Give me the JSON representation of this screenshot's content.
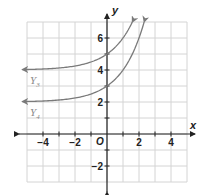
{
  "chart_data": {
    "type": "line",
    "title": "",
    "xlabel": "x",
    "ylabel": "y",
    "origin_label": "O",
    "xlim": [
      -5,
      5
    ],
    "ylim": [
      -3,
      7
    ],
    "grid": true,
    "x_ticks": [
      -4,
      -2,
      2,
      4
    ],
    "x_tick_labels": [
      "−4",
      "−2",
      "2",
      "4"
    ],
    "y_ticks": [
      -2,
      2,
      4,
      6
    ],
    "y_tick_labels": [
      "−2",
      "2",
      "4",
      "6"
    ],
    "series": [
      {
        "name": "Y3",
        "label": "Y",
        "subscript": "3",
        "equation": "y = 2^x + 4",
        "asymptote": 4,
        "y_intercept": 5,
        "x_range": [
          -5,
          1.58
        ],
        "color": "#7a7a7a"
      },
      {
        "name": "Y4",
        "label": "Y",
        "subscript": "4",
        "equation": "y = 2^x + 2",
        "asymptote": 2,
        "y_intercept": 3,
        "x_range": [
          -5,
          2.32
        ],
        "color": "#7a7a7a"
      }
    ]
  },
  "colors": {
    "grid": "#d4d4d4",
    "axis": "#222222",
    "curve": "#7a7a7a",
    "label": "#222222",
    "series_label": "#8a8a8a"
  }
}
